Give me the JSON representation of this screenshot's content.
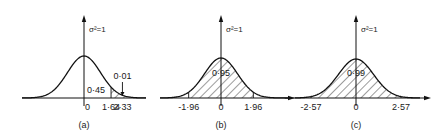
{
  "chart_data": [
    {
      "type": "area",
      "title": "",
      "caption": "(a)",
      "distribution": "standard normal",
      "variance_label": "σ²=1",
      "mean": 0,
      "variance": 1,
      "x_ticks": [
        "0",
        "1·64",
        "2·33"
      ],
      "x_tick_values": [
        0,
        1.64,
        2.33
      ],
      "shaded_regions": [
        {
          "from": 1.64,
          "to": 3.6
        }
      ],
      "annotations": [
        {
          "text": "0·45",
          "meaning": "area between 0 and 1.64",
          "x": 0.5,
          "value": 0.45
        },
        {
          "text": "0·01",
          "meaning": "upper tail area beyond 2.33",
          "x": 2.33,
          "value": 0.01,
          "arrow": true
        }
      ],
      "xlim": [
        -3.6,
        3.6
      ]
    },
    {
      "type": "area",
      "title": "",
      "caption": "(b)",
      "distribution": "standard normal",
      "variance_label": "σ²=1",
      "mean": 0,
      "variance": 1,
      "x_ticks": [
        "-1·96",
        "0",
        "1·96"
      ],
      "x_tick_values": [
        -1.96,
        0,
        1.96
      ],
      "shaded_regions": [
        {
          "from": -1.96,
          "to": 1.96
        }
      ],
      "annotations": [
        {
          "text": "0·95",
          "meaning": "central area between -1.96 and 1.96",
          "x": 0,
          "value": 0.95
        }
      ],
      "xlim": [
        -3.6,
        3.6
      ]
    },
    {
      "type": "area",
      "title": "",
      "caption": "(c)",
      "distribution": "standard normal",
      "variance_label": "σ²=1",
      "mean": 0,
      "variance": 1,
      "x_ticks": [
        "-2·57",
        "0",
        "2·57"
      ],
      "x_tick_values": [
        -2.57,
        0,
        2.57
      ],
      "shaded_regions": [
        {
          "from": -2.57,
          "to": 2.57
        }
      ],
      "annotations": [
        {
          "text": "0·99",
          "meaning": "central area between -2.57 and 2.57",
          "x": 0,
          "value": 0.99
        }
      ],
      "xlim": [
        -3.6,
        3.6
      ]
    }
  ]
}
